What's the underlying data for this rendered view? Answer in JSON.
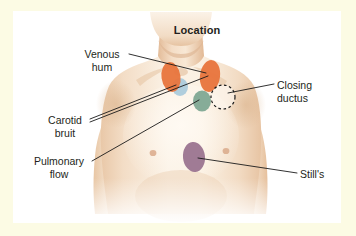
{
  "figure": {
    "title": "Location",
    "background_color": "#fcfbe4",
    "plate_color": "#ffffff",
    "text_color": "#231f20",
    "leader_line_color": "#1a1a1a"
  },
  "callouts": [
    {
      "id": "venous-hum",
      "label": "Venous\nhum",
      "marker_color": "#e8743c",
      "marker_shape": "ellipse",
      "align": "center",
      "x": 74,
      "y": 48,
      "width": 56
    },
    {
      "id": "carotid-bruit",
      "label": "Carotid\nbruit",
      "marker_color": "#a9cadb",
      "marker_shape": "ellipse",
      "align": "center",
      "x": 37,
      "y": 114,
      "width": 56
    },
    {
      "id": "pulmonary-flow",
      "label": "Pulmonary\nflow",
      "marker_color": "#7fa893",
      "marker_shape": "ellipse",
      "align": "center",
      "x": 23,
      "y": 155,
      "width": 72
    },
    {
      "id": "closing-ductus",
      "label": "Closing\nductus",
      "marker_color": "#ffffff",
      "marker_shape": "dashed-circle",
      "align": "left",
      "x": 277,
      "y": 79,
      "width": 62
    },
    {
      "id": "stills",
      "label": "Still's",
      "marker_color": "#9b7490",
      "marker_shape": "ellipse",
      "align": "left",
      "x": 300,
      "y": 168,
      "width": 46
    }
  ],
  "markers": [
    {
      "id": "venous-hum-left",
      "color": "#e8743c",
      "cx": 171,
      "cy": 77,
      "rx": 9.5,
      "ry": 15,
      "rotate": -8
    },
    {
      "id": "venous-hum-right",
      "color": "#e8743c",
      "cx": 210,
      "cy": 76,
      "rx": 10,
      "ry": 16,
      "rotate": 8
    },
    {
      "id": "carotid-bruit-marker",
      "color": "#a9cadb",
      "cx": 180,
      "cy": 87,
      "rx": 8,
      "ry": 9,
      "rotate": 0
    },
    {
      "id": "pulmonary-flow-marker",
      "color": "#7fa893",
      "cx": 202,
      "cy": 101,
      "rx": 9,
      "ry": 10.5,
      "rotate": 0
    },
    {
      "id": "closing-ductus-marker",
      "color": "#ffffff",
      "cx": 223,
      "cy": 97,
      "rx": 12,
      "ry": 12,
      "rotate": 0
    },
    {
      "id": "stills-marker",
      "color": "#9b7490",
      "cx": 194,
      "cy": 157,
      "rx": 11,
      "ry": 15,
      "rotate": -6
    }
  ],
  "skin": {
    "base": "#f6e3cf",
    "light": "#fbf1e4",
    "mid": "#edd0b4",
    "shadow": "#ddb896",
    "nipple": "#d9ab8d"
  }
}
